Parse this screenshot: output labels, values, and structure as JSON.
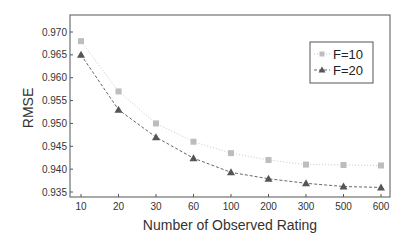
{
  "chart_data": {
    "type": "line",
    "title": "",
    "xlabel": "Number of Observed Rating",
    "ylabel": "RMSE",
    "categories": [
      "10",
      "20",
      "30",
      "60",
      "100",
      "200",
      "300",
      "500",
      "600"
    ],
    "ylim": [
      0.935,
      0.97
    ],
    "yticks": [
      "0.935",
      "0.940",
      "0.945",
      "0.950",
      "0.955",
      "0.960",
      "0.965",
      "0.970"
    ],
    "grid": false,
    "legend_position": "upper right",
    "series": [
      {
        "name": "F=10",
        "marker": "square",
        "line_style": "dotted",
        "color": "#b0b0b0",
        "values": [
          0.968,
          0.957,
          0.95,
          0.946,
          0.9435,
          0.942,
          0.941,
          0.9409,
          0.9408
        ]
      },
      {
        "name": "F=20",
        "marker": "triangle",
        "line_style": "dashed",
        "color": "#555555",
        "values": [
          0.965,
          0.953,
          0.947,
          0.9424,
          0.9393,
          0.9379,
          0.9369,
          0.9362,
          0.936
        ]
      }
    ]
  }
}
